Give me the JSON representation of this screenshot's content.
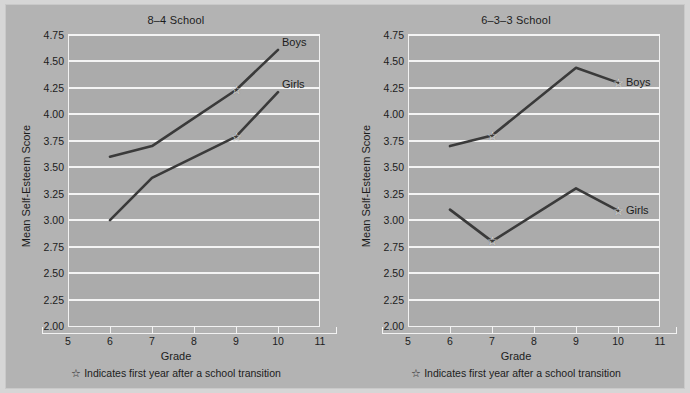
{
  "figure": {
    "background_color": "#b3b3b3",
    "plot_background_color": "#ababab",
    "gridline_color": "#f4f4f4",
    "line_color": "#3a3a3a",
    "star_glyph": "☆"
  },
  "panels": [
    {
      "title": "8–4 School",
      "xlabel": "Grade",
      "ylabel": "Mean Self-Esteem Score",
      "footnote": "Indicates first year after a school transition",
      "boys_label": "Boys",
      "girls_label": "Girls"
    },
    {
      "title": "6–3–3 School",
      "xlabel": "Grade",
      "ylabel": "Mean Self-Esteem Score",
      "footnote": "Indicates first year after a school transition",
      "boys_label": "Boys",
      "girls_label": "Girls"
    }
  ],
  "chart_data": [
    {
      "type": "line",
      "title": "8–4 School",
      "xlabel": "Grade",
      "ylabel": "Mean Self-Esteem Score",
      "xlim": [
        5,
        11
      ],
      "ylim": [
        2.0,
        4.75
      ],
      "xticks": [
        5,
        6,
        7,
        8,
        9,
        10,
        11
      ],
      "xtick_labels": [
        "5",
        "6",
        "7",
        "8",
        "9",
        "10",
        "11"
      ],
      "yticks": [
        2.0,
        2.25,
        2.5,
        2.75,
        3.0,
        3.25,
        3.5,
        3.75,
        4.0,
        4.25,
        4.5,
        4.75
      ],
      "ytick_labels": [
        "2.00",
        "2.25",
        "2.50",
        "2.75",
        "3.00",
        "3.25",
        "3.50",
        "3.75",
        "4.00",
        "4.25",
        "4.50",
        "4.75"
      ],
      "grid": true,
      "legend_position": "inline-right",
      "x": [
        6,
        7,
        9,
        10
      ],
      "series": [
        {
          "name": "Boys",
          "values": [
            3.6,
            3.7,
            4.23,
            4.61
          ],
          "transition_marker_x": 9,
          "transition_marker_y": 4.23
        },
        {
          "name": "Girls",
          "values": [
            3.0,
            3.4,
            3.79,
            4.21
          ],
          "transition_marker_x": 9,
          "transition_marker_y": 3.79
        }
      ],
      "annotations": [
        "☆ Indicates first year after a school transition"
      ]
    },
    {
      "type": "line",
      "title": "6–3–3 School",
      "xlabel": "Grade",
      "ylabel": "Mean Self-Esteem Score",
      "xlim": [
        5,
        11
      ],
      "ylim": [
        2.0,
        4.75
      ],
      "xticks": [
        5,
        6,
        7,
        8,
        9,
        10,
        11
      ],
      "xtick_labels": [
        "5",
        "6",
        "7",
        "8",
        "9",
        "10",
        "11"
      ],
      "yticks": [
        2.0,
        2.25,
        2.5,
        2.75,
        3.0,
        3.25,
        3.5,
        3.75,
        4.0,
        4.25,
        4.5,
        4.75
      ],
      "ytick_labels": [
        "2.00",
        "2.25",
        "2.50",
        "2.75",
        "3.00",
        "3.25",
        "3.50",
        "3.75",
        "4.00",
        "4.25",
        "4.50",
        "4.75"
      ],
      "grid": true,
      "legend_position": "inline-right",
      "x": [
        6,
        7,
        9,
        10
      ],
      "series": [
        {
          "name": "Boys",
          "values": [
            3.7,
            3.8,
            4.44,
            4.3
          ],
          "transition_marker_x": 7,
          "transition_marker_y": 3.8,
          "transition_marker_x2": 10,
          "transition_marker_y2": 4.3
        },
        {
          "name": "Girls",
          "values": [
            3.1,
            2.8,
            3.3,
            3.09
          ],
          "transition_marker_x": 7,
          "transition_marker_y": 2.8,
          "transition_marker_x2": 10,
          "transition_marker_y2": 3.09
        }
      ],
      "annotations": [
        "☆ Indicates first year after a school transition"
      ]
    }
  ]
}
